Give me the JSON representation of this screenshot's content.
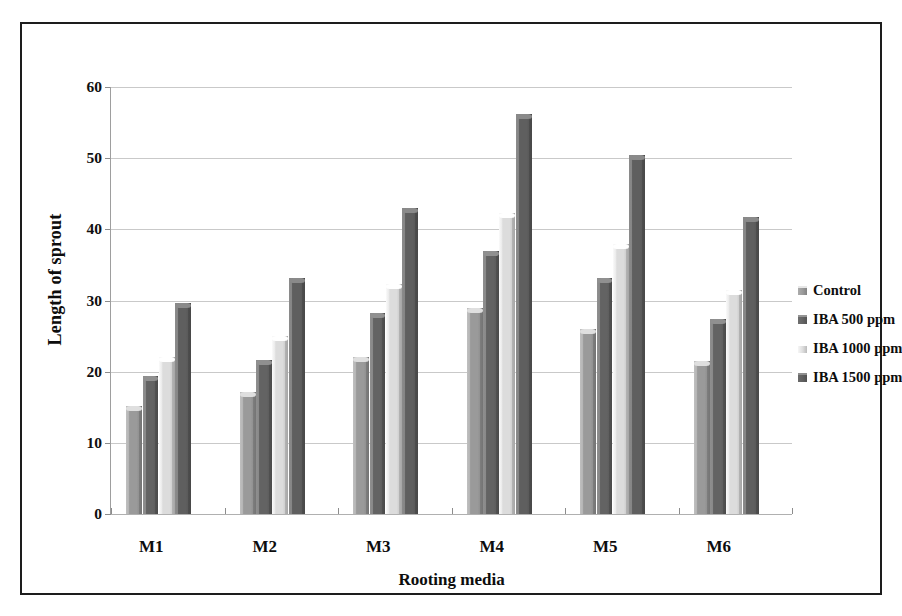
{
  "chart_data": {
    "type": "bar",
    "title": "",
    "subtitle": "",
    "xlabel": "Rooting media",
    "ylabel": "Length of sprout",
    "categories": [
      "M1",
      "M2",
      "M3",
      "M4",
      "M5",
      "M6"
    ],
    "series": [
      {
        "name": "Control",
        "color": "#9a9a9a",
        "values": [
          15.2,
          17.1,
          22.0,
          29.0,
          26.0,
          21.5
        ]
      },
      {
        "name": "IBA 500 ppm",
        "color": "#636363",
        "values": [
          19.4,
          21.7,
          28.3,
          37.0,
          33.2,
          27.4
        ]
      },
      {
        "name": "IBA 1000 ppm",
        "color": "#dcdcdc",
        "values": [
          22.0,
          25.0,
          32.3,
          42.3,
          38.0,
          31.5
        ]
      },
      {
        "name": "IBA 1500 ppm",
        "color": "#5f5f5f",
        "values": [
          29.6,
          33.2,
          43.0,
          56.2,
          50.4,
          41.8
        ]
      }
    ],
    "ylim": [
      0,
      60
    ],
    "ytick_values": [
      0,
      10,
      20,
      30,
      40,
      50,
      60
    ],
    "ytick_labels": [
      "0",
      "10",
      "20",
      "30",
      "40",
      "50",
      "60"
    ],
    "grid": true,
    "grid_axis": "y",
    "legend_position": "right",
    "plot_background": "#ffffff",
    "gridline_color": "#c9c9c9",
    "frame_border_color": "#1d1d1d"
  },
  "legend": {
    "items": [
      {
        "label": "Control",
        "color": "#9a9a9a"
      },
      {
        "label": "IBA 500 ppm",
        "color": "#636363"
      },
      {
        "label": "IBA 1000 ppm",
        "color": "#dcdcdc"
      },
      {
        "label": "IBA 1500 ppm",
        "color": "#5f5f5f"
      }
    ]
  }
}
